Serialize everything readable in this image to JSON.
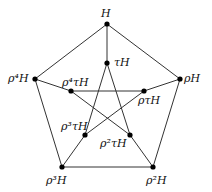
{
  "diagram": {
    "type": "Petersen graph (coset graph)",
    "line_color": "#333333",
    "node_color": "#000000",
    "nodes": [
      {
        "id": "H",
        "label": "H",
        "x": 107,
        "y": 24,
        "lx": 101,
        "ly": 8
      },
      {
        "id": "rH",
        "label": "ρH",
        "x": 180,
        "y": 79,
        "lx": 184,
        "ly": 73
      },
      {
        "id": "r2H",
        "label": "ρ²H",
        "x": 153,
        "y": 167,
        "lx": 146,
        "ly": 175
      },
      {
        "id": "r3H",
        "label": "ρ³H",
        "x": 62,
        "y": 167,
        "lx": 46,
        "ly": 175
      },
      {
        "id": "r4H",
        "label": "ρ⁴H",
        "x": 35,
        "y": 79,
        "lx": 8,
        "ly": 73
      },
      {
        "id": "tH",
        "label": "τH",
        "x": 107,
        "y": 63,
        "lx": 114,
        "ly": 57
      },
      {
        "id": "rtH",
        "label": "ρτH",
        "x": 144,
        "y": 91,
        "lx": 138,
        "ly": 95
      },
      {
        "id": "r2tH",
        "label": "ρ²τH",
        "x": 130,
        "y": 135,
        "lx": 100,
        "ly": 138
      },
      {
        "id": "r3tH",
        "label": "ρ³τH",
        "x": 85,
        "y": 135,
        "lx": 61,
        "ly": 121
      },
      {
        "id": "r4tH",
        "label": "ρ⁴τH",
        "x": 71,
        "y": 91,
        "lx": 62,
        "ly": 77
      }
    ],
    "edges": [
      [
        "H",
        "rH"
      ],
      [
        "rH",
        "r2H"
      ],
      [
        "r2H",
        "r3H"
      ],
      [
        "r3H",
        "r4H"
      ],
      [
        "r4H",
        "H"
      ],
      [
        "H",
        "tH"
      ],
      [
        "rH",
        "rtH"
      ],
      [
        "r2H",
        "r2tH"
      ],
      [
        "r3H",
        "r3tH"
      ],
      [
        "r4H",
        "r4tH"
      ],
      [
        "tH",
        "r2tH"
      ],
      [
        "tH",
        "r3tH"
      ],
      [
        "rtH",
        "r3tH"
      ],
      [
        "rtH",
        "r4tH"
      ],
      [
        "r2tH",
        "r4tH"
      ]
    ]
  }
}
